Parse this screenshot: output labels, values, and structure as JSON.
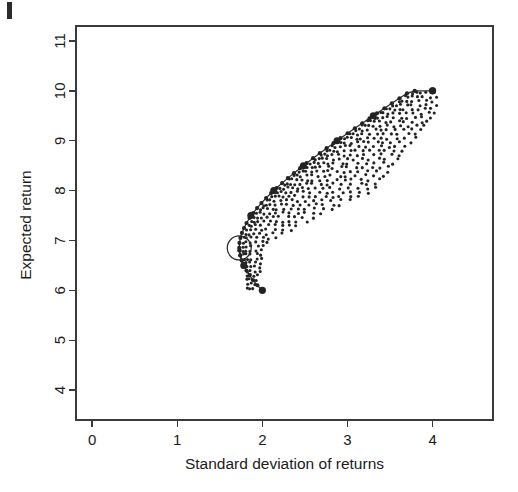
{
  "figure": {
    "kind": "scatter-plot",
    "background_color": "#ffffff",
    "ink_color": "#242424",
    "width": 518,
    "height": 492,
    "scan_artifact": {
      "name": "page-edge-artifact",
      "visible": true
    }
  },
  "chart_data": {
    "type": "scatter",
    "title": "",
    "subtitle": "",
    "xlabel": "Standard deviation of returns",
    "ylabel": "Expected return",
    "xlim": [
      -0.19,
      4.71
    ],
    "ylim": [
      3.4,
      11.3
    ],
    "xticks": [
      0,
      1,
      2,
      3,
      4
    ],
    "xtick_labels": [
      "0",
      "1",
      "2",
      "3",
      "4"
    ],
    "yticks": [
      4,
      5,
      6,
      7,
      8,
      9,
      10,
      11
    ],
    "ytick_labels": [
      "4",
      "5",
      "6",
      "7",
      "8",
      "9",
      "10",
      "11"
    ],
    "grid": false,
    "legend": null,
    "legend_position": "none",
    "axis_style": "box",
    "series": [
      {
        "name": "efficient-frontier",
        "role": "frontier-curve",
        "marker": "filled-circle",
        "marker_size": 5.2,
        "line": true,
        "points": [
          [
            1.781,
            6.5
          ],
          [
            1.757,
            6.6
          ],
          [
            1.74,
            6.7
          ],
          [
            1.731,
            6.8
          ],
          [
            1.728,
            6.85
          ],
          [
            1.731,
            6.95
          ],
          [
            1.742,
            7.05
          ],
          [
            1.76,
            7.15
          ],
          [
            1.784,
            7.25
          ],
          [
            1.814,
            7.35
          ],
          [
            1.85,
            7.45
          ],
          [
            1.864,
            7.5
          ],
          [
            1.892,
            7.55
          ],
          [
            1.938,
            7.65
          ],
          [
            1.989,
            7.75
          ],
          [
            2.044,
            7.85
          ],
          [
            2.103,
            7.95
          ],
          [
            2.133,
            8.0
          ],
          [
            2.166,
            8.05
          ],
          [
            2.232,
            8.15
          ],
          [
            2.3,
            8.25
          ],
          [
            2.371,
            8.35
          ],
          [
            2.444,
            8.45
          ],
          [
            2.481,
            8.5
          ],
          [
            2.519,
            8.55
          ],
          [
            2.596,
            8.65
          ],
          [
            2.675,
            8.75
          ],
          [
            2.755,
            8.85
          ],
          [
            2.836,
            8.95
          ],
          [
            2.877,
            9.0
          ],
          [
            2.918,
            9.05
          ],
          [
            3.002,
            9.15
          ],
          [
            3.087,
            9.25
          ],
          [
            3.173,
            9.35
          ],
          [
            3.259,
            9.45
          ],
          [
            3.303,
            9.5
          ],
          [
            3.346,
            9.55
          ],
          [
            3.434,
            9.65
          ],
          [
            3.522,
            9.75
          ],
          [
            3.611,
            9.85
          ],
          [
            3.7,
            9.95
          ],
          [
            3.79,
            10.0
          ]
        ],
        "emphasis_points": [
          [
            1.781,
            6.5
          ],
          [
            1.864,
            7.5
          ],
          [
            2.133,
            8.0
          ],
          [
            2.481,
            8.5
          ],
          [
            2.877,
            9.0
          ],
          [
            3.303,
            9.5
          ],
          [
            4.0,
            10.0
          ]
        ]
      },
      {
        "name": "lower-boundary",
        "role": "inefficient-lower-branch",
        "marker": "filled-circle",
        "marker_size": 4.4,
        "line": true,
        "points": [
          [
            1.731,
            6.8
          ],
          [
            1.74,
            6.7
          ],
          [
            1.757,
            6.6
          ],
          [
            1.781,
            6.5
          ],
          [
            1.812,
            6.4
          ],
          [
            1.85,
            6.3
          ],
          [
            1.893,
            6.2
          ],
          [
            1.942,
            6.1
          ],
          [
            1.996,
            6.0
          ]
        ]
      },
      {
        "name": "attainable-portfolios",
        "role": "feasible-set-cloud",
        "marker": "filled-circle",
        "marker_size": 3.0,
        "line": false,
        "description": "Suboptimal portfolios spreading to the right of the frontier at discrete expected-return levels"
      }
    ],
    "annotations": [
      {
        "name": "minimum-variance-portfolio",
        "marker": "open-circle",
        "x": 1.728,
        "y": 6.85,
        "radius_px": 12,
        "label": ""
      },
      {
        "name": "maximum-return-portfolio",
        "marker": "filled-circle",
        "x": 4.0,
        "y": 10.0,
        "label": ""
      },
      {
        "name": "minimum-return-portfolio",
        "marker": "filled-circle",
        "x": 2.0,
        "y": 6.0,
        "label": ""
      }
    ]
  }
}
